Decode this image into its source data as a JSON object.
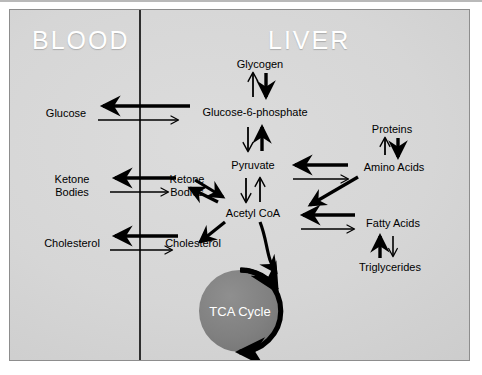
{
  "figure": {
    "compartments": {
      "left_label": "BLOOD",
      "right_label": "LIVER"
    },
    "colors": {
      "panel_light": "#dcdcdc",
      "panel_dark": "#c2c2c2",
      "panel_border": "#8d8d8d",
      "divider": "#2e2e2e",
      "arrow": "#000000",
      "node_text": "#000000",
      "compartment_text": "#ffffff",
      "tca_fill": "#808080",
      "tca_text": "#ffffff",
      "page_background": "#ffffff"
    }
  },
  "blood_nodes": [
    {
      "id": "blood-glucose",
      "label": "Glucose"
    },
    {
      "id": "blood-ketone",
      "label": "Ketone Bodies"
    },
    {
      "id": "blood-cholesterol",
      "label": "Cholesterol"
    }
  ],
  "liver_nodes": [
    {
      "id": "glycogen",
      "label": "Glycogen"
    },
    {
      "id": "g6p",
      "label": "Glucose-6-phosphate"
    },
    {
      "id": "pyruvate",
      "label": "Pyruvate"
    },
    {
      "id": "acetyl-coa",
      "label": "Acetyl CoA"
    },
    {
      "id": "proteins",
      "label": "Proteins"
    },
    {
      "id": "amino-acids",
      "label": "Amino Acids"
    },
    {
      "id": "fatty-acids",
      "label": "Fatty Acids"
    },
    {
      "id": "triglycerides",
      "label": "Triglycerides"
    },
    {
      "id": "liver-ketone",
      "label": "Ketone Bodies"
    },
    {
      "id": "liver-cholesterol",
      "label": "Cholesterol"
    }
  ],
  "ketone_lines": {
    "line1": "Ketone",
    "line2": "Bodies"
  },
  "tca": {
    "label": "TCA Cycle"
  },
  "reactions": [
    {
      "from": "Glucose-6-phosphate",
      "to": "Glucose",
      "direction": "liver-to-blood",
      "weight": "thick"
    },
    {
      "from": "Glucose",
      "to": "Glucose-6-phosphate",
      "direction": "blood-to-liver",
      "weight": "thin"
    },
    {
      "from": "Ketone Bodies (liver)",
      "to": "Ketone Bodies (blood)",
      "direction": "liver-to-blood",
      "weight": "thick"
    },
    {
      "from": "Ketone Bodies (blood)",
      "to": "Ketone Bodies (liver)",
      "direction": "blood-to-liver",
      "weight": "thin"
    },
    {
      "from": "Cholesterol (liver)",
      "to": "Cholesterol (blood)",
      "direction": "liver-to-blood",
      "weight": "thick"
    },
    {
      "from": "Cholesterol (blood)",
      "to": "Cholesterol (liver)",
      "direction": "blood-to-liver",
      "weight": "thin"
    },
    {
      "from": "Glucose-6-phosphate",
      "to": "Glycogen",
      "direction": "up",
      "weight": "thin"
    },
    {
      "from": "Glycogen",
      "to": "Glucose-6-phosphate",
      "direction": "down",
      "weight": "thick"
    },
    {
      "from": "Glucose-6-phosphate",
      "to": "Pyruvate",
      "direction": "down",
      "weight": "thin"
    },
    {
      "from": "Pyruvate",
      "to": "Glucose-6-phosphate",
      "direction": "up",
      "weight": "thick"
    },
    {
      "from": "Pyruvate",
      "to": "Acetyl CoA",
      "direction": "down",
      "weight": "thin"
    },
    {
      "from": "Acetyl CoA",
      "to": "Pyruvate",
      "direction": "up",
      "weight": "thin"
    },
    {
      "from": "Amino Acids",
      "to": "Proteins",
      "direction": "up",
      "weight": "thin"
    },
    {
      "from": "Proteins",
      "to": "Amino Acids",
      "direction": "down",
      "weight": "thick"
    },
    {
      "from": "Amino Acids",
      "to": "Pyruvate",
      "direction": "left",
      "weight": "thick"
    },
    {
      "from": "Pyruvate",
      "to": "Amino Acids",
      "direction": "right",
      "weight": "thin"
    },
    {
      "from": "Amino Acids",
      "to": "Acetyl CoA",
      "direction": "diagonal-down-left",
      "weight": "thick"
    },
    {
      "from": "Fatty Acids",
      "to": "Acetyl CoA",
      "direction": "left",
      "weight": "thick"
    },
    {
      "from": "Acetyl CoA",
      "to": "Fatty Acids",
      "direction": "right",
      "weight": "thin"
    },
    {
      "from": "Triglycerides",
      "to": "Fatty Acids",
      "direction": "up",
      "weight": "thick"
    },
    {
      "from": "Fatty Acids",
      "to": "Triglycerides",
      "direction": "down",
      "weight": "thin"
    },
    {
      "from": "Acetyl CoA",
      "to": "Ketone Bodies (liver)",
      "direction": "diagonal-up-left",
      "weight": "thick"
    },
    {
      "from": "Ketone Bodies (liver)",
      "to": "Acetyl CoA",
      "direction": "diagonal-down-right",
      "weight": "thick"
    },
    {
      "from": "Acetyl CoA",
      "to": "Cholesterol (liver)",
      "direction": "diagonal-down-left",
      "weight": "thick"
    },
    {
      "from": "Acetyl CoA",
      "to": "TCA Cycle",
      "direction": "curved-down",
      "weight": "thick"
    }
  ]
}
